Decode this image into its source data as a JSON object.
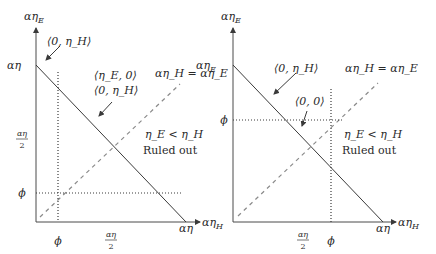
{
  "panels": [
    {
      "id": "left",
      "y_axis_label": "αη",
      "y_axis_label_sub": "E",
      "x_axis_label": "αη",
      "x_axis_label_sub": "H",
      "y_intercept_label": "αη",
      "x_intercept_label": "αη",
      "y_half_label_num": "αη",
      "y_half_label_den": "2",
      "x_half_label_num": "αη",
      "x_half_label_den": "2",
      "phi_y_label": "ϕ",
      "phi_x_label": "ϕ",
      "diag_label": "αη_H = αη_E",
      "annotation_top": "⟨0, η_H⟩",
      "annotation_mid_1": "⟨η_E, 0⟩",
      "annotation_mid_2": "⟨0, η_H⟩",
      "region_label_1": "η_E < η_H",
      "region_label_2": "Ruled out"
    },
    {
      "id": "right",
      "y_axis_label": "αη",
      "y_axis_label_sub": "E",
      "x_axis_label": "αη",
      "x_axis_label_sub": "H",
      "y_intercept_label": "αη",
      "y_intercept_label_sub": "E",
      "x_intercept_label": "αη",
      "x_half_label_num": "αη",
      "x_half_label_den": "2",
      "phi_y_label": "ϕ",
      "phi_x_label": "ϕ",
      "diag_label": "αη_H = αη_E",
      "annotation_top": "⟨0, η_H⟩",
      "annotation_mid": "⟨0, 0⟩",
      "region_label_1": "η_E < η_H",
      "region_label_2": "Ruled out"
    }
  ],
  "caption_fragment": "Figure 11.1 ..."
}
